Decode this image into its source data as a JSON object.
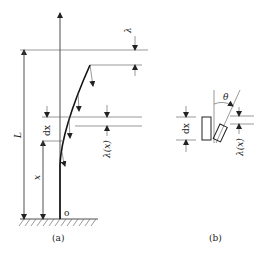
{
  "figure": {
    "panel_a": {
      "caption": "(a)",
      "labels": {
        "length": "L",
        "position": "x",
        "element": "dx",
        "tip_deflection": "λ",
        "local_deflection": "λ(x)",
        "origin": "o"
      }
    },
    "panel_b": {
      "caption": "(b)",
      "labels": {
        "angle": "θ",
        "element": "dx",
        "local_deflection": "λ(x)"
      }
    }
  },
  "colors": {
    "line": "#222222",
    "background": "#ffffff"
  }
}
